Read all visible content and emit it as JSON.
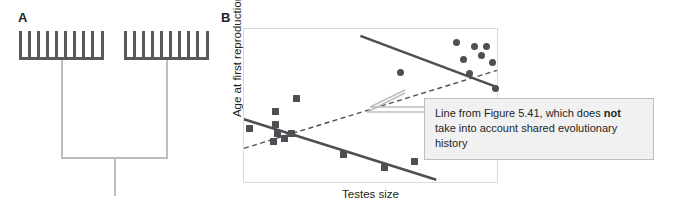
{
  "figure": {
    "panels": [
      {
        "id": "A",
        "label": "A",
        "type": "phylogeny"
      },
      {
        "id": "B",
        "label": "B",
        "type": "scatter"
      }
    ]
  },
  "panel_a": {
    "label": "A",
    "description": "Phylogenetic tree with two sister clades",
    "clades": [
      {
        "name": "left-clade",
        "tip_count": 10
      },
      {
        "name": "right-clade",
        "tip_count": 10
      }
    ],
    "colors": {
      "backbone": "#58595b",
      "stem": "#bcbec0"
    }
  },
  "panel_b": {
    "label": "B",
    "callout": {
      "text_before": "Line from Figure 5.41, which does ",
      "emphasis": "not",
      "text_after": " take into account shared evolutionary history",
      "full_text": "Line from Figure 5.41, which does not take into account shared evolutionary history",
      "border_color": "#bcbec0",
      "fill_color": "#f1f1f2"
    }
  },
  "chart_data": {
    "type": "scatter",
    "title": "",
    "xlabel": "Testes size",
    "ylabel": "Age at first reproduction",
    "xlim": [
      0,
      100
    ],
    "ylim": [
      0,
      100
    ],
    "grid": false,
    "axis_ticks": false,
    "legend": null,
    "marker_color": "#4d4f53",
    "series": [
      {
        "name": "clade-1-circles",
        "marker": "circle",
        "marker_size_px": 7,
        "points": [
          [
            61.5,
            72.0
          ],
          [
            83.5,
            91.5
          ],
          [
            90.5,
            89.0
          ],
          [
            95.0,
            89.0
          ],
          [
            86.0,
            80.5
          ],
          [
            93.0,
            83.0
          ],
          [
            97.5,
            78.5
          ],
          [
            88.5,
            71.0
          ],
          [
            98.5,
            61.5
          ],
          [
            89.0,
            44.0
          ]
        ]
      },
      {
        "name": "clade-2-squares",
        "marker": "square",
        "marker_size_px": 7,
        "points": [
          [
            2.0,
            35.5
          ],
          [
            12.5,
            46.5
          ],
          [
            12.5,
            38.5
          ],
          [
            13.0,
            32.5
          ],
          [
            11.5,
            27.5
          ],
          [
            16.0,
            29.5
          ],
          [
            18.5,
            32.5
          ],
          [
            20.5,
            55.0
          ],
          [
            39.0,
            19.0
          ],
          [
            55.0,
            10.5
          ],
          [
            67.0,
            14.5
          ]
        ]
      }
    ],
    "lines": [
      {
        "name": "clade-1-regression",
        "style": "solid",
        "color": "#4d4f53",
        "width_px": 2.6,
        "x": [
          46.0,
          100.0
        ],
        "y": [
          95.5,
          62.0
        ],
        "slope_sign": "negative"
      },
      {
        "name": "clade-2-regression",
        "style": "solid",
        "color": "#4d4f53",
        "width_px": 2.6,
        "x": [
          0.0,
          76.0
        ],
        "y": [
          41.0,
          1.5
        ],
        "slope_sign": "negative"
      },
      {
        "name": "pooled-regression-ignoring-phylogeny",
        "style": "dashed",
        "color": "#4d4f53",
        "width_px": 1.4,
        "x": [
          0.0,
          100.0
        ],
        "y": [
          22.0,
          73.0
        ],
        "slope_sign": "positive"
      }
    ]
  }
}
